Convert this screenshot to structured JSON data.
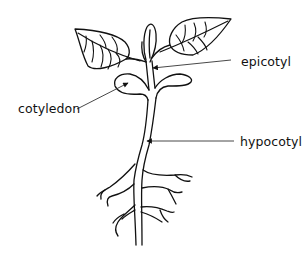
{
  "diagram": {
    "colors": {
      "ink": "#111111",
      "background": "#ffffff"
    },
    "labels": [
      {
        "id": "epicotyl",
        "text": "epicotyl",
        "side": "right",
        "target": "stem above cotyledons"
      },
      {
        "id": "cotyledon",
        "text": "cotyledon",
        "side": "left",
        "target": "seed leaf"
      },
      {
        "id": "hypocotyl",
        "text": "hypocotyl",
        "side": "right",
        "target": "stem below cotyledons"
      }
    ],
    "parts": [
      "true-leaf-left",
      "true-leaf-right",
      "terminal-bud",
      "cotyledon-left",
      "cotyledon-right",
      "epicotyl",
      "hypocotyl",
      "roots"
    ]
  }
}
